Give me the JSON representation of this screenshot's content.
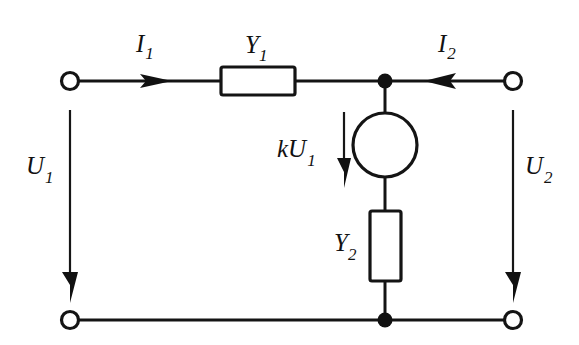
{
  "figure": {
    "background_color": "#ffffff",
    "line_color": "#141414"
  },
  "labels": {
    "i1": {
      "base": "I",
      "sub": "1"
    },
    "i2": {
      "base": "I",
      "sub": "2"
    },
    "u1": {
      "base": "U",
      "sub": "1"
    },
    "u2": {
      "base": "U",
      "sub": "2"
    },
    "y1": {
      "base": "Y",
      "sub": "1"
    },
    "y2": {
      "base": "Y",
      "sub": "2"
    },
    "ku1": {
      "base": "kU",
      "sub": "1"
    }
  },
  "components": {
    "y1_resistor": {
      "name": "Y1",
      "orientation": "horizontal"
    },
    "y2_resistor": {
      "name": "Y2",
      "orientation": "vertical"
    },
    "source": {
      "name": "kU1",
      "symbol": "circle",
      "type": "controlled-source"
    }
  },
  "terminals": {
    "input_top": "terminal-1",
    "input_bottom": "terminal-1-prime",
    "output_top": "terminal-2",
    "output_bottom": "terminal-2-prime"
  },
  "arrows": {
    "i1_direction": "right",
    "i2_direction": "left",
    "u1_direction": "down",
    "u2_direction": "down",
    "ku1_direction": "down"
  }
}
